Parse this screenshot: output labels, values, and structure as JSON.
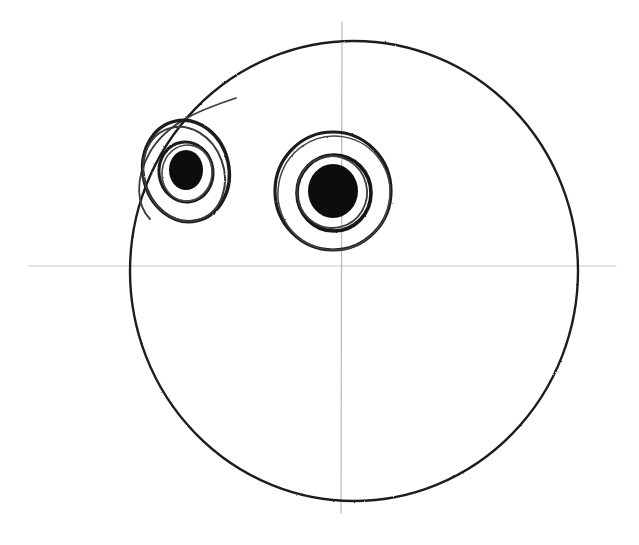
{
  "document": {
    "title": "Hand-drawn face construction sketch",
    "width": 639,
    "height": 545,
    "background_color": "#ffffff",
    "medium": "pencil-on-paper scan"
  },
  "palette": {
    "ink_dark": "#1a1a1a",
    "ink_mid": "#3a3a3a",
    "guideline_gray": "#b8b8b8",
    "guideline_gray_faint": "#cccccc",
    "paper": "#ffffff"
  },
  "guides": {
    "horizontal_axis": {
      "label": "horizontal construction line",
      "x1": 28,
      "y1": 266,
      "x2": 616,
      "y2": 266,
      "color": "#c2c2c2",
      "stroke_width": 1
    },
    "vertical_axis": {
      "label": "vertical construction line",
      "x1": 342,
      "y1": 22,
      "x2": 341,
      "y2": 513,
      "color": "#b0b0b0",
      "stroke_width": 1.2
    },
    "origin": {
      "x": 342,
      "y": 266
    }
  },
  "shapes": {
    "head_circle": {
      "name": "head outline",
      "cx": 354,
      "cy": 271,
      "rx": 224,
      "ry": 230,
      "color": "#1f1f1f",
      "stroke_width": 2.4,
      "fill": "none"
    },
    "left_eye": {
      "name": "left eye",
      "cx": 186,
      "cy": 171,
      "rings": [
        {
          "name": "outer-ring",
          "rx": 43,
          "ry": 51,
          "stroke_width": 3.4,
          "color": "#1a1a1a",
          "rotate": -12,
          "dx": 0,
          "dy": 0
        },
        {
          "name": "outer-ring-echo",
          "rx": 40,
          "ry": 48,
          "stroke_width": 2.0,
          "color": "#3a3a3a",
          "rotate": -20,
          "dx": -2,
          "dy": 3
        },
        {
          "name": "middle-ring",
          "rx": 27,
          "ry": 30,
          "stroke_width": 3.0,
          "color": "#1a1a1a",
          "rotate": -8,
          "dx": 0,
          "dy": 1
        },
        {
          "name": "middle-ring-echo",
          "rx": 25,
          "ry": 28,
          "stroke_width": 1.6,
          "color": "#4a4a4a",
          "rotate": 6,
          "dx": 1,
          "dy": 2
        }
      ],
      "pupil": {
        "name": "left pupil",
        "rx": 17,
        "ry": 20,
        "fill": "#0b0b0b",
        "dx": 0,
        "dy": -1
      }
    },
    "right_eye": {
      "name": "right eye",
      "cx": 333,
      "cy": 191,
      "rings": [
        {
          "name": "outer-ring",
          "rx": 58,
          "ry": 59,
          "stroke_width": 3.2,
          "color": "#1a1a1a",
          "rotate": 0,
          "dx": 0,
          "dy": 0
        },
        {
          "name": "outer-ring-echo",
          "rx": 56,
          "ry": 57,
          "stroke_width": 1.5,
          "color": "#444444",
          "rotate": 10,
          "dx": 1,
          "dy": 2
        },
        {
          "name": "middle-ring",
          "rx": 37,
          "ry": 38,
          "stroke_width": 3.6,
          "color": "#141414",
          "rotate": 0,
          "dx": 1,
          "dy": 2
        },
        {
          "name": "middle-ring-echo",
          "rx": 35,
          "ry": 36,
          "stroke_width": 1.8,
          "color": "#3d3d3d",
          "rotate": -14,
          "dx": -1,
          "dy": 1
        }
      ],
      "pupil": {
        "name": "right pupil",
        "rx": 25,
        "ry": 27,
        "fill": "#0b0b0b",
        "dx": 0,
        "dy": 0
      }
    },
    "sketch_tail": {
      "name": "stray construction arc near left eye",
      "path": "M 236 98 C 206 108, 168 121, 150 152 C 134 180, 137 206, 150 219",
      "color": "#3a3a3a",
      "stroke_width": 1.8
    }
  },
  "annotations": {
    "visible_text": [],
    "note": "No labels or text appear anywhere in the image."
  }
}
